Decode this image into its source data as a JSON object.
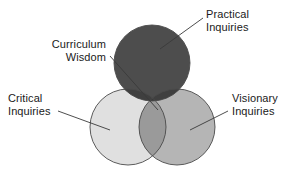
{
  "diagram": {
    "type": "venn-3-circle",
    "background_color": "#ffffff",
    "stroke_color": "#444444",
    "text_color": "#1a1a1a",
    "circles": [
      {
        "id": "practical",
        "label_line1": "Practical",
        "label_line2": "Inquiries",
        "fill_color": "#4d4d4d",
        "cx": 152,
        "cy": 63,
        "r": 38
      },
      {
        "id": "critical",
        "label_line1": "Critical",
        "label_line2": "Inquiries",
        "fill_color": "#e0e0e0",
        "cx": 128,
        "cy": 127,
        "r": 38
      },
      {
        "id": "visionary",
        "label_line1": "Visionary",
        "label_line2": "Inquiries",
        "fill_color": "#b5b5b5",
        "cx": 177,
        "cy": 127,
        "r": 38
      }
    ],
    "center": {
      "id": "curriculum-wisdom",
      "label_line1": "Curriculum",
      "label_line2": "Wisdom",
      "fill_color": "#3a3a3a"
    },
    "leaders": [
      {
        "id": "leader-practical",
        "x1": 203,
        "y1": 18,
        "x2": 160,
        "y2": 49
      },
      {
        "id": "leader-curriculum",
        "x1": 110,
        "y1": 56,
        "x2": 158,
        "y2": 110
      },
      {
        "id": "leader-critical",
        "x1": 58,
        "y1": 111,
        "x2": 110,
        "y2": 130
      },
      {
        "id": "leader-visionary",
        "x1": 228,
        "y1": 111,
        "x2": 190,
        "y2": 130
      }
    ]
  }
}
